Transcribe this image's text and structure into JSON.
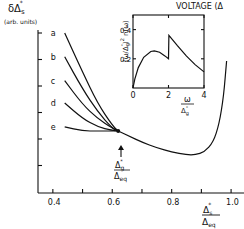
{
  "header": {
    "running_title": "VOLTAGE (Δ"
  },
  "chart_data": [
    {
      "type": "line",
      "title": "",
      "ylabel": "δΔ*s",
      "ylabel_unit": "(arb. units)",
      "xlabel": "Δ*s / Δeq",
      "xlim": [
        0.35,
        1.03
      ],
      "ylim": [
        0,
        1
      ],
      "xticks": [
        0.4,
        0.5,
        0.6,
        0.7,
        0.8,
        0.9,
        1.0
      ],
      "xtick_labels": [
        "0.4",
        "",
        "0.6",
        "",
        "0.8",
        "",
        "1.0"
      ],
      "yticks_unlabeled": 6,
      "grid": false,
      "annotation": {
        "text_num": "Δ*g",
        "text_den": "Δeq",
        "x": 0.62,
        "y": 0.3
      },
      "series": [
        {
          "name": "a",
          "x": [
            0.44,
            0.5,
            0.55,
            0.6,
            0.62
          ],
          "y": [
            1.0,
            0.72,
            0.5,
            0.34,
            0.3
          ]
        },
        {
          "name": "b",
          "x": [
            0.44,
            0.5,
            0.55,
            0.6,
            0.62
          ],
          "y": [
            0.83,
            0.6,
            0.44,
            0.32,
            0.3
          ]
        },
        {
          "name": "c",
          "x": [
            0.44,
            0.5,
            0.55,
            0.6,
            0.62
          ],
          "y": [
            0.66,
            0.49,
            0.39,
            0.32,
            0.3
          ]
        },
        {
          "name": "d",
          "x": [
            0.44,
            0.5,
            0.55,
            0.6,
            0.62
          ],
          "y": [
            0.5,
            0.39,
            0.33,
            0.305,
            0.3
          ]
        },
        {
          "name": "e",
          "x": [
            0.44,
            0.5,
            0.55,
            0.6,
            0.62
          ],
          "y": [
            0.33,
            0.3,
            0.3,
            0.3,
            0.3
          ]
        },
        {
          "name": "common",
          "x": [
            0.62,
            0.66,
            0.7,
            0.75,
            0.8,
            0.85,
            0.88,
            0.91,
            0.94,
            0.96,
            0.975,
            0.985
          ],
          "y": [
            0.3,
            0.26,
            0.22,
            0.18,
            0.15,
            0.13,
            0.13,
            0.15,
            0.22,
            0.35,
            0.55,
            0.8
          ]
        }
      ],
      "labels": [
        "a",
        "b",
        "c",
        "d",
        "e"
      ]
    },
    {
      "type": "line",
      "title": "",
      "position": "top-right inset",
      "xlabel": "ω / Δ*g",
      "ylabel": "(ω/Δ*g)² n(ω)",
      "xlim": [
        0,
        4
      ],
      "ylim": [
        0,
        0.5
      ],
      "xticks": [
        0,
        2,
        4
      ],
      "xtick_labels": [
        "0",
        "2",
        "4"
      ],
      "yticks": [
        0.2,
        0.4
      ],
      "ytick_labels": [
        "0.2",
        "0.4"
      ],
      "grid": false,
      "series": [
        {
          "name": "spectrum",
          "x": [
            0,
            0.1,
            0.3,
            0.6,
            1.0,
            1.2,
            1.5,
            1.8,
            2.0,
            2.02,
            2.5,
            3.0,
            3.5,
            4.0
          ],
          "y": [
            0.0,
            0.06,
            0.14,
            0.21,
            0.25,
            0.255,
            0.245,
            0.22,
            0.2,
            0.36,
            0.29,
            0.22,
            0.16,
            0.11
          ]
        }
      ]
    }
  ]
}
